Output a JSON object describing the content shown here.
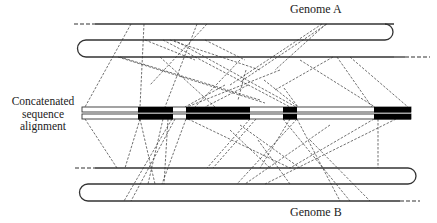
{
  "labels": {
    "genome_a": "Genome A",
    "genome_b": "Genome B",
    "alignment": "Concatenated sequence alignment"
  },
  "colors": {
    "stroke": "#333333",
    "block_fill": "#000000",
    "background": "#ffffff"
  },
  "genome_a": {
    "upper_line": {
      "x1": 74,
      "x2": 425,
      "y": 24,
      "dash_left_end": 95,
      "dash_right_start": 405
    },
    "chromosome": {
      "x1": 78,
      "x2": 394,
      "y_top": 40,
      "y_bottom": 57
    },
    "lower_line": {
      "x1": 78,
      "x2": 430,
      "y": 57,
      "dash_right_start": 400
    }
  },
  "genome_b": {
    "upper_line": {
      "x1": 75,
      "x2": 430,
      "y": 168,
      "dash_left_end": 95
    },
    "chromosome": {
      "x1": 80,
      "x2": 414,
      "y_top": 184,
      "y_bottom": 201
    },
    "lower_line": {
      "x1": 80,
      "x2": 420,
      "y": 201,
      "dash_right_start": 400
    }
  },
  "alignment": {
    "x1": 82,
    "x2": 411,
    "rows": [
      {
        "y": 107,
        "h": 5
      },
      {
        "y": 114,
        "h": 5
      }
    ],
    "blocks": [
      {
        "x1": 138,
        "x2": 173
      },
      {
        "x1": 186,
        "x2": 250
      },
      {
        "x1": 283,
        "x2": 297
      },
      {
        "x1": 374,
        "x2": 411
      }
    ]
  },
  "links_top": [
    [
      131,
      24,
      85,
      107
    ],
    [
      144,
      24,
      140,
      107
    ],
    [
      197,
      24,
      165,
      107
    ],
    [
      207,
      24,
      150,
      85
    ],
    [
      326,
      24,
      275,
      70
    ],
    [
      327,
      24,
      240,
      82
    ],
    [
      322,
      24,
      230,
      85
    ],
    [
      333,
      57,
      275,
      90
    ],
    [
      163,
      40,
      290,
      107
    ],
    [
      170,
      40,
      260,
      70
    ],
    [
      120,
      57,
      260,
      100
    ],
    [
      118,
      57,
      265,
      103
    ],
    [
      160,
      57,
      215,
      107
    ],
    [
      205,
      40,
      245,
      60
    ],
    [
      174,
      40,
      296,
      107
    ],
    [
      264,
      80,
      298,
      107
    ],
    [
      337,
      57,
      372,
      107
    ],
    [
      350,
      57,
      408,
      107
    ],
    [
      240,
      60,
      195,
      107
    ],
    [
      246,
      70,
      238,
      100
    ],
    [
      145,
      40,
      195,
      60
    ],
    [
      300,
      60,
      375,
      107
    ],
    [
      280,
      70,
      187,
      107
    ],
    [
      225,
      85,
      185,
      107
    ],
    [
      248,
      85,
      205,
      107
    ],
    [
      284,
      88,
      298,
      107
    ]
  ],
  "links_bottom": [
    [
      85,
      119,
      117,
      168
    ],
    [
      140,
      119,
      125,
      168
    ],
    [
      140,
      119,
      155,
      184
    ],
    [
      163,
      119,
      148,
      184
    ],
    [
      172,
      119,
      124,
      201
    ],
    [
      175,
      119,
      131,
      201
    ],
    [
      186,
      119,
      162,
      184
    ],
    [
      168,
      119,
      164,
      184
    ],
    [
      250,
      119,
      207,
      168
    ],
    [
      256,
      119,
      213,
      168
    ],
    [
      188,
      119,
      290,
      168
    ],
    [
      290,
      119,
      260,
      168
    ],
    [
      297,
      119,
      340,
      201
    ],
    [
      283,
      119,
      350,
      201
    ],
    [
      297,
      119,
      237,
      184
    ],
    [
      374,
      119,
      290,
      168
    ],
    [
      396,
      119,
      265,
      184
    ],
    [
      378,
      119,
      378,
      168
    ],
    [
      240,
      125,
      300,
      168
    ],
    [
      310,
      140,
      370,
      201
    ],
    [
      258,
      140,
      290,
      184
    ],
    [
      330,
      125,
      245,
      184
    ],
    [
      230,
      130,
      270,
      168
    ]
  ]
}
